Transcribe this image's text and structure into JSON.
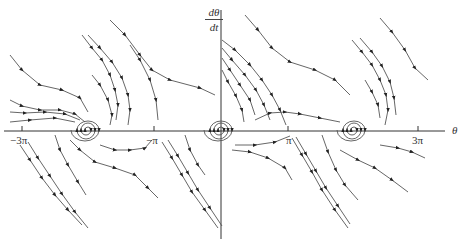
{
  "diagram": {
    "type": "phase-portrait",
    "y_axis_label": {
      "numerator": "dθ",
      "denominator": "dt"
    },
    "x_axis_label": "θ",
    "ticks": [
      {
        "label": "−3π",
        "x": 22
      },
      {
        "label": "−π",
        "x": 154
      },
      {
        "label": "π",
        "x": 288
      },
      {
        "label": "3π",
        "x": 418
      }
    ],
    "spiral_sinks_x": [
      88,
      220,
      354
    ],
    "saddles_x": [
      22,
      154,
      288,
      418
    ],
    "colors": {
      "curves": "#444444",
      "axes": "#333333",
      "background": "#ffffff"
    }
  }
}
